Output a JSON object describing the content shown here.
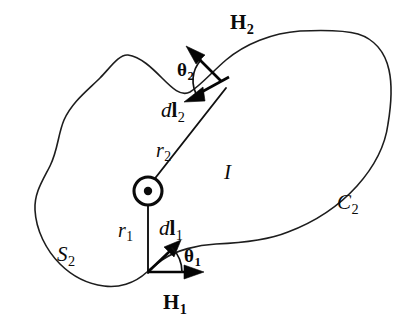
{
  "figure": {
    "background_color": "#ffffff",
    "stroke_color": "#1d1d1d",
    "width": 413,
    "height": 335
  },
  "labels": {
    "H2": {
      "symbol": "H",
      "subscript": "2",
      "style": "bold-upright",
      "meaning": "magnetic-field-vector-2"
    },
    "theta2": {
      "symbol": "θ",
      "subscript": "2",
      "style": "bold-upright",
      "meaning": "angle-between-H2-and-dl2"
    },
    "dl2": {
      "prefix": "d",
      "symbol": "l",
      "subscript": "2",
      "style": "italic-d-bold-l",
      "meaning": "line-element-2"
    },
    "r2": {
      "symbol": "r",
      "subscript": "2",
      "style": "italic",
      "meaning": "radius-vector-2"
    },
    "I": {
      "symbol": "I",
      "subscript": "",
      "style": "italic",
      "meaning": "current"
    },
    "C2": {
      "symbol": "C",
      "subscript": "2",
      "style": "italic",
      "meaning": "contour-2"
    },
    "r1": {
      "symbol": "r",
      "subscript": "1",
      "style": "italic",
      "meaning": "radius-vector-1"
    },
    "dl1": {
      "prefix": "d",
      "symbol": "l",
      "subscript": "1",
      "style": "italic-d-bold-l",
      "meaning": "line-element-1"
    },
    "theta1": {
      "symbol": "θ",
      "subscript": "1",
      "style": "bold-upright",
      "meaning": "angle-between-H1-and-dl1"
    },
    "S2": {
      "symbol": "S",
      "subscript": "2",
      "style": "italic",
      "meaning": "surface-2"
    },
    "H1": {
      "symbol": "H",
      "subscript": "1",
      "style": "bold-upright",
      "meaning": "magnetic-field-vector-1"
    }
  },
  "geometry": {
    "current_symbol": {
      "name": "current-out-of-page",
      "center_x": 148,
      "center_y": 191,
      "outer_radius": 14,
      "dot_radius": 4
    },
    "boundary_path": "M 128 55 C 150 58 168 76 188 90 C 206 103 222 96 240 78 C 262 56 300 34 330 32 C 352 31 372 44 384 66 C 394 84 391 104 388 124 C 384 150 372 170 352 190 C 330 212 300 228 272 236 C 252 242 222 243 200 245 C 180 247 162 258 148 272 C 130 286 112 288 98 285 C 80 281 64 272 52 258 C 38 242 30 222 32 202 C 34 184 44 172 50 158 C 57 142 58 128 66 116 C 76 100 92 88 104 76 C 114 66 120 56 128 55 Z",
    "r2_line": {
      "x1": 148,
      "y1": 191,
      "x2": 224,
      "y2": 92
    },
    "r1_line": {
      "x1": 148,
      "y1": 191,
      "x2": 148,
      "y2": 272
    },
    "vectors": [
      {
        "name": "H2-arrow",
        "x1": 222,
        "y1": 82,
        "x2": 187,
        "y2": 47,
        "label": "H2"
      },
      {
        "name": "dl2-arrow",
        "x1": 228,
        "y1": 78,
        "x2": 185,
        "y2": 101,
        "label": "dl2"
      },
      {
        "name": "dl1-arrow",
        "x1": 148,
        "y1": 272,
        "x2": 180,
        "y2": 241,
        "label": "dl1"
      },
      {
        "name": "H1-arrow",
        "x1": 148,
        "y1": 272,
        "x2": 203,
        "y2": 272,
        "label": "H1"
      }
    ],
    "angle_arcs": [
      {
        "name": "theta2-arc",
        "vertex_x": 223,
        "vertex_y": 80,
        "radius": 27
      },
      {
        "name": "theta1-arc",
        "vertex_x": 148,
        "vertex_y": 272,
        "radius": 34
      }
    ]
  }
}
